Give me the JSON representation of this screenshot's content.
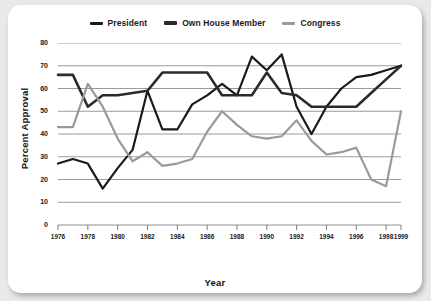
{
  "chart_data": {
    "type": "line",
    "title": "",
    "xlabel": "Year",
    "ylabel": "Percent Approval",
    "xlim": [
      1976,
      1999
    ],
    "ylim": [
      0,
      80
    ],
    "ytick_step": 10,
    "yticks": [
      0,
      10,
      20,
      30,
      40,
      50,
      60,
      70,
      80
    ],
    "xticks": [
      1976,
      1978,
      1980,
      1982,
      1984,
      1986,
      1988,
      1990,
      1992,
      1994,
      1996,
      1998,
      1999
    ],
    "xticklabels": [
      "1976",
      "1978",
      "1980",
      "1982",
      "1984",
      "1986",
      "1988",
      "1990",
      "1992",
      "1994",
      "1996",
      "1998",
      "1999"
    ],
    "grid": true,
    "grid_axis": "y",
    "legend_position": "top-center",
    "x": [
      1976,
      1977,
      1978,
      1979,
      1980,
      1981,
      1982,
      1983,
      1984,
      1985,
      1986,
      1987,
      1988,
      1989,
      1990,
      1991,
      1992,
      1993,
      1994,
      1995,
      1996,
      1997,
      1998,
      1999
    ],
    "series": [
      {
        "name": "President",
        "color": "#1a1a1a",
        "width": 2.2,
        "values": [
          27,
          29,
          27,
          16,
          25,
          33,
          59,
          42,
          42,
          53,
          57,
          62,
          57,
          74,
          68,
          75,
          52,
          40,
          52,
          60,
          65,
          66,
          68,
          70
        ]
      },
      {
        "name": "Own House Member",
        "color": "#2b2b2b",
        "width": 2.6,
        "values": [
          66,
          66,
          52,
          57,
          57,
          58,
          59,
          67,
          67,
          67,
          67,
          57,
          57,
          57,
          67,
          58,
          57,
          52,
          52,
          52,
          52,
          58,
          64,
          70
        ]
      },
      {
        "name": "Congress",
        "color": "#9a9a9a",
        "width": 2.2,
        "values": [
          43,
          43,
          62,
          52,
          38,
          28,
          32,
          26,
          27,
          29,
          41,
          50,
          44,
          39,
          38,
          39,
          46,
          37,
          31,
          32,
          34,
          20,
          17,
          50
        ]
      }
    ]
  },
  "legend": {
    "items": [
      {
        "label": "President",
        "color": "#1a1a1a"
      },
      {
        "label": "Own House Member",
        "color": "#2b2b2b"
      },
      {
        "label": "Congress",
        "color": "#9a9a9a"
      }
    ]
  },
  "axes": {
    "y_title": "Percent Approval",
    "x_title": "Year"
  }
}
